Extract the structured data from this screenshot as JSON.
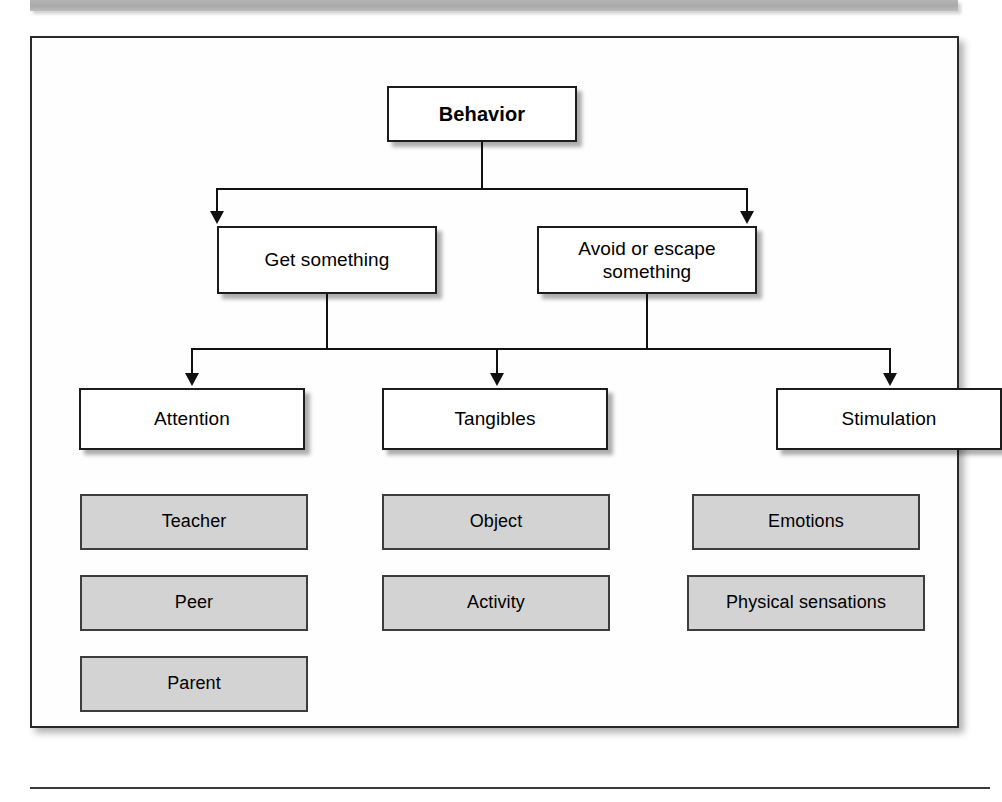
{
  "figure": {
    "root": {
      "label": "Behavior"
    },
    "functions": [
      {
        "label": "Get something"
      },
      {
        "label": "Avoid or escape\nsomething",
        "line1": "Avoid or escape",
        "line2": "something"
      }
    ],
    "categories": [
      {
        "label": "Attention"
      },
      {
        "label": "Tangibles"
      },
      {
        "label": "Stimulation"
      }
    ],
    "examples": {
      "attention": [
        "Teacher",
        "Peer",
        "Parent"
      ],
      "tangibles": [
        "Object",
        "Activity"
      ],
      "stimulation": [
        "Emotions",
        "Physical sensations"
      ]
    }
  },
  "colors": {
    "node_fill": "#ffffff",
    "example_fill": "#d3d3d3",
    "border": "#1c1c1c",
    "example_border": "#3d3d3d",
    "banner": "#adadad",
    "line": "#111111"
  }
}
